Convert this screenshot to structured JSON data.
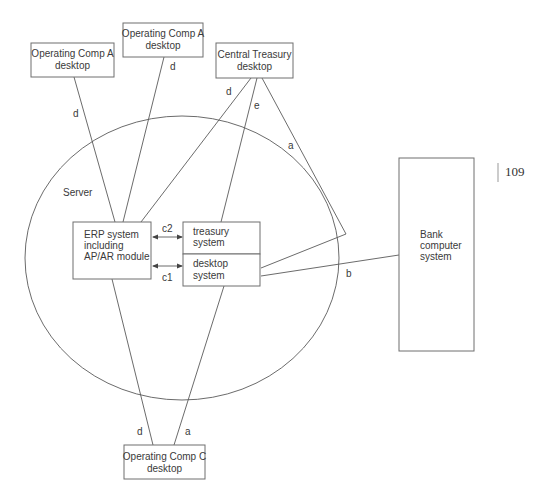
{
  "diagram": {
    "server_label": "Server",
    "nodes": {
      "opcomp_a1": {
        "line1": "Operating Comp A",
        "line2": "desktop"
      },
      "opcomp_a2": {
        "line1": "Operating Comp A",
        "line2": "desktop"
      },
      "central_treasury": {
        "line1": "Central Treasury",
        "line2": "desktop"
      },
      "erp": {
        "line1": "ERP system",
        "line2": "including",
        "line3": "AP/AR module"
      },
      "treasury_system": {
        "line1": "treasury",
        "line2": "system"
      },
      "desktop_system": {
        "line1": "desktop",
        "line2": "system"
      },
      "bank": {
        "line1": "Bank",
        "line2": "computer",
        "line3": "system"
      },
      "opcomp_c": {
        "line1": "Operating Comp C",
        "line2": "desktop"
      }
    },
    "edge_labels": {
      "d_opcomp_a1": "d",
      "d_opcomp_a2": "d",
      "d_central_treasury": "d",
      "e_central_treasury": "e",
      "a_central_treasury": "a",
      "b_bank": "b",
      "c2": "c2",
      "c1": "c1",
      "d_opcomp_c": "d",
      "a_opcomp_c": "a"
    }
  },
  "page": {
    "number": "109"
  }
}
